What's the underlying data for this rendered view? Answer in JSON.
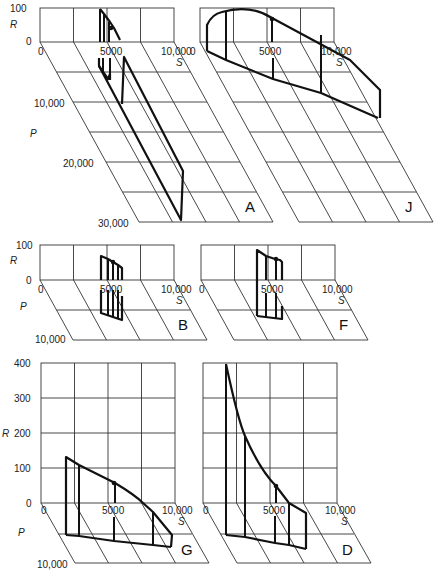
{
  "figure": {
    "axes": {
      "r_label": "R",
      "s_label": "S",
      "p_label": "P"
    },
    "panels": [
      {
        "id": "A",
        "letter": "A",
        "r_ticks": [
          "0",
          "100"
        ],
        "s_ticks": [
          "0",
          "5000",
          "10,000"
        ],
        "p_ticks": [
          "10,000",
          "20,000",
          "30,000"
        ]
      },
      {
        "id": "J",
        "letter": "J",
        "r_ticks": [],
        "s_ticks": [
          "0",
          "5000",
          "10,000"
        ],
        "p_ticks": []
      },
      {
        "id": "B",
        "letter": "B",
        "r_ticks": [
          "0",
          "100"
        ],
        "s_ticks": [
          "0",
          "5000",
          "10,000"
        ],
        "p_ticks": [
          "10,000"
        ]
      },
      {
        "id": "F",
        "letter": "F",
        "r_ticks": [],
        "s_ticks": [
          "0",
          "5000",
          "10,000"
        ],
        "p_ticks": []
      },
      {
        "id": "G",
        "letter": "G",
        "r_ticks": [
          "0",
          "100",
          "200",
          "300",
          "400"
        ],
        "s_ticks": [
          "0",
          "5000",
          "10,000"
        ],
        "p_ticks": [
          "10,000"
        ]
      },
      {
        "id": "D",
        "letter": "D",
        "r_ticks": [],
        "s_ticks": [
          "0",
          "5000",
          "10,000"
        ],
        "p_ticks": []
      }
    ]
  }
}
